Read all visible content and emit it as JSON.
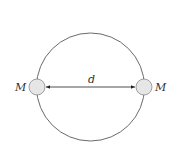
{
  "diagram": {
    "orbit": {
      "cx": 90.5,
      "cy": 87,
      "r": 54,
      "stroke": "#6b6b6b"
    },
    "masses": [
      {
        "label": "M",
        "cx": 37,
        "cy": 87,
        "r": 8,
        "fill": "#e6e6e6",
        "stroke": "#8a8a8a"
      },
      {
        "label": "M",
        "cx": 144,
        "cy": 87,
        "r": 8,
        "fill": "#e6e6e6",
        "stroke": "#8a8a8a"
      }
    ],
    "separation": {
      "label": "d"
    }
  }
}
